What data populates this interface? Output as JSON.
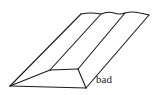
{
  "diagram": {
    "label": "bad",
    "stroke_color": "#1a1a1a",
    "background": "#ffffff"
  }
}
